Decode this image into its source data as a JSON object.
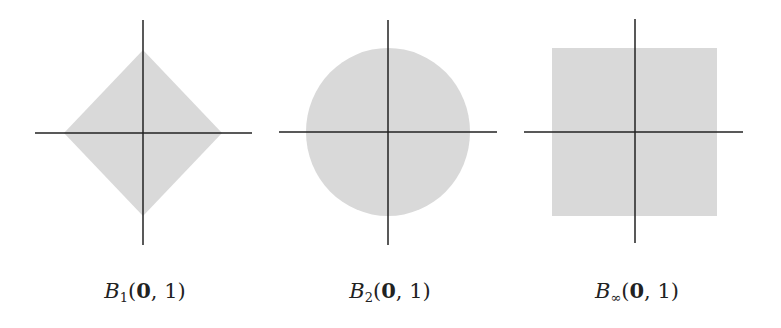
{
  "figure": {
    "fill_color": "#d9d9d9",
    "axis_color": "#222222",
    "panels": [
      {
        "id": "l1",
        "shape": "diamond",
        "label": {
          "base": "B",
          "sub": "1",
          "args_bold": "0",
          "args_rest": ", 1",
          "open": "(",
          "close": ")"
        }
      },
      {
        "id": "l2",
        "shape": "circle",
        "label": {
          "base": "B",
          "sub": "2",
          "args_bold": "0",
          "args_rest": ", 1",
          "open": "(",
          "close": ")"
        }
      },
      {
        "id": "linf",
        "shape": "square",
        "label": {
          "base": "B",
          "sub": "∞",
          "args_bold": "0",
          "args_rest": ", 1",
          "open": "(",
          "close": ")"
        }
      }
    ]
  }
}
